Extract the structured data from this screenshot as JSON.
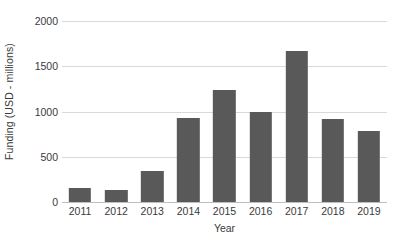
{
  "chart_data": {
    "type": "bar",
    "title": "",
    "xlabel": "Year",
    "ylabel": "Funding (USD - millions)",
    "categories": [
      "2011",
      "2012",
      "2013",
      "2014",
      "2015",
      "2016",
      "2017",
      "2018",
      "2019"
    ],
    "values": [
      155,
      130,
      345,
      930,
      1235,
      995,
      1665,
      915,
      785
    ],
    "ylim": [
      0,
      2000
    ],
    "yticks": [
      0,
      500,
      1000,
      1500,
      2000
    ],
    "ytick_labels": [
      "0",
      "500",
      "1000",
      "1500",
      "2000"
    ],
    "grid": true,
    "grid_axis": "y",
    "legend": false,
    "legend_position": "none",
    "bar_color": "#595959",
    "gridline_color": "#d9d9d9",
    "axis_color": "#bfbfbf",
    "text_color": "#3a3a3a",
    "background_color": "#ffffff"
  }
}
